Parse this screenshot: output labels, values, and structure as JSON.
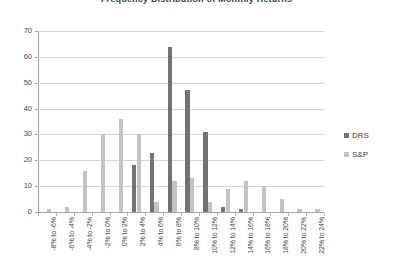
{
  "chart_data": {
    "type": "bar",
    "title": "Frequency Distribution of Monthly Returns",
    "xlabel": "",
    "ylabel": "",
    "ylim": [
      0,
      70
    ],
    "ytick_step": 10,
    "yticks": [
      0,
      10,
      20,
      30,
      40,
      50,
      60,
      70
    ],
    "grid": true,
    "legend_position": "right",
    "categories": [
      "-8% to -6%",
      "-6% to -4%",
      "-4% to -2%",
      "-2% to 0%",
      "0% to 2%",
      "2% to 4%",
      "4% to 6%",
      "6% to 8%",
      "8% to 10%",
      "10% to 12%",
      "12% to 14%",
      "14% to 16%",
      "16% to 18%",
      "18% to 20%",
      "20% to 22%",
      "22% to 24%"
    ],
    "series": [
      {
        "name": "DRS",
        "color": "#737373",
        "values": [
          0,
          0,
          0,
          0,
          0,
          18,
          23,
          64,
          47,
          31,
          2,
          1,
          0,
          0,
          0,
          0
        ]
      },
      {
        "name": "S&P",
        "color": "#c4c4c4",
        "values": [
          1,
          2,
          16,
          30,
          36,
          30,
          4,
          12,
          13,
          4,
          9,
          12,
          10,
          5,
          1,
          1
        ]
      }
    ]
  },
  "legend": {
    "items": [
      {
        "label": "DRS",
        "color": "#737373"
      },
      {
        "label": "S&P",
        "color": "#c4c4c4"
      }
    ]
  }
}
